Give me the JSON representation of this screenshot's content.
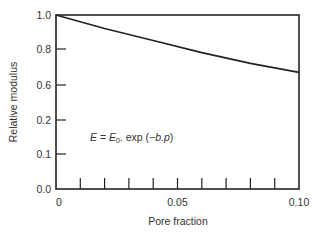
{
  "chart_data": {
    "type": "line",
    "title": "",
    "xlabel": "Pore fraction",
    "ylabel": "Relative modulus",
    "xlim": [
      0,
      0.1
    ],
    "ylim": [
      0.0,
      1.0
    ],
    "x_ticks": [
      {
        "value": 0,
        "label": "0"
      },
      {
        "value": 0.05,
        "label": "0.05"
      },
      {
        "value": 0.1,
        "label": "0.10"
      }
    ],
    "x_minor_ticks": [
      0.01,
      0.02,
      0.03,
      0.04,
      0.05,
      0.06,
      0.07,
      0.08,
      0.09
    ],
    "y_ticks": [
      {
        "value": 1.0,
        "label": "1.0",
        "py": 15
      },
      {
        "value": 0.8,
        "label": "0.8",
        "py": 49
      },
      {
        "value": 0.6,
        "label": "0.6",
        "py": 85
      },
      {
        "value": 0.2,
        "label": "0.2",
        "py": 120
      },
      {
        "value": 0.1,
        "label": "0.1",
        "py": 154
      },
      {
        "value": 0.0,
        "label": "0.0",
        "py": 189
      }
    ],
    "series": [
      {
        "name": "E = E0 exp(-b.p)",
        "x": [
          0,
          0.02,
          0.04,
          0.06,
          0.08,
          0.1
        ],
        "values": [
          1.0,
          0.92,
          0.85,
          0.78,
          0.72,
          0.67
        ]
      }
    ],
    "annotations": [
      {
        "text_parts": [
          "E",
          " = ",
          "E",
          "0",
          ". exp (",
          "−b.p",
          ")"
        ],
        "display": "E = E0. exp (−b.p)"
      }
    ],
    "grid": false,
    "legend": "none"
  },
  "labels": {
    "xlabel": "Pore fraction",
    "ylabel": "Relative modulus",
    "eq_E": "E",
    "eq_eq": " = ",
    "eq_E0": "E",
    "eq_sub": "0",
    "eq_rest": ". exp (",
    "eq_arg": "−b.p",
    "eq_close": ")"
  }
}
